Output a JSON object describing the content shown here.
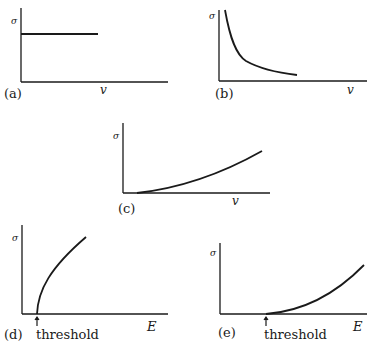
{
  "figure": {
    "panels": [
      {
        "id": "a",
        "caption": "(a)",
        "y_label": "σ",
        "x_label": "v",
        "shape": "constant",
        "threshold_label": null
      },
      {
        "id": "b",
        "caption": "(b)",
        "y_label": "σ",
        "x_label": "v",
        "shape": "inverse (1/v decay)",
        "threshold_label": null
      },
      {
        "id": "c",
        "caption": "(c)",
        "y_label": "σ",
        "x_label": "v",
        "shape": "increasing from near zero",
        "threshold_label": null
      },
      {
        "id": "d",
        "caption": "(d)",
        "y_label": "σ",
        "x_label": "E",
        "shape": "steep rise from threshold (square-root like)",
        "threshold_label": "threshold"
      },
      {
        "id": "e",
        "caption": "(e)",
        "y_label": "σ",
        "x_label": "E",
        "shape": "slow rise from threshold (power-law)",
        "threshold_label": "threshold"
      }
    ]
  }
}
